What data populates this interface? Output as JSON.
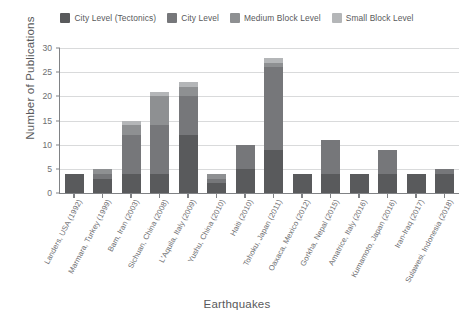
{
  "chart_data": {
    "type": "bar",
    "stacked": true,
    "title": "",
    "xlabel": "Earthquakes",
    "ylabel": "Number of Publications",
    "ylim": [
      0,
      30
    ],
    "yticks": [
      0,
      5,
      10,
      15,
      20,
      25,
      30
    ],
    "grid": true,
    "legend_position": "top-center",
    "categories": [
      "Landers, USA (1992)",
      "Marmara, Turkey (1999)",
      "Bam, Iran (2003)",
      "Sichuan, China (2008)",
      "L'Aquila, Italy (2009)",
      "Yushu, China (2010)",
      "Haiti (2010)",
      "Tohoku, Japan (2011)",
      "Oaxaca, Mexico (2012)",
      "Gorkha, Nepal (2015)",
      "Amatrice, Italy (2016)",
      "Kumamoto, Japan (2016)",
      "Iran-Iraq (2017)",
      "Sulawesi, Indonesia (2018)"
    ],
    "series": [
      {
        "name": "City Level (Tectonics)",
        "color": "#595a5c",
        "values": [
          4,
          3,
          4,
          4,
          12,
          2,
          5,
          9,
          4,
          4,
          4,
          4,
          4,
          4
        ]
      },
      {
        "name": "City Level",
        "color": "#76777a",
        "values": [
          0,
          1,
          8,
          10,
          8,
          1,
          5,
          17,
          0,
          7,
          0,
          5,
          0,
          1
        ]
      },
      {
        "name": "Medium Block Level",
        "color": "#8e9092",
        "values": [
          0,
          1,
          2,
          6,
          2,
          1,
          0,
          1,
          0,
          0,
          0,
          0,
          0,
          0
        ]
      },
      {
        "name": "Small Block Level",
        "color": "#b4b6b8",
        "values": [
          0,
          0,
          1,
          1,
          1,
          0,
          0,
          1,
          0,
          0,
          0,
          0,
          0,
          0
        ]
      }
    ],
    "totals": [
      4,
      5,
      15,
      21,
      23,
      4,
      10,
      28,
      4,
      11,
      4,
      9,
      4,
      5
    ],
    "axis_color": "#808285",
    "grid_color": "#d9dadb",
    "text_color": "#6d6e71"
  }
}
